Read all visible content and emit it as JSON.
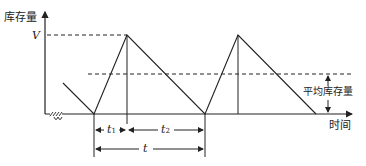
{
  "diagram": {
    "type": "inventory-sawtooth",
    "y_axis_label": "库存量",
    "x_axis_label": "时间",
    "max_level_label": "V",
    "average_label": "平均库存量",
    "dim_t1": "t",
    "dim_t1_sub": "1",
    "dim_t2": "t",
    "dim_t2_sub": "2",
    "dim_t": "t",
    "axis_break_symbol": "≈"
  }
}
